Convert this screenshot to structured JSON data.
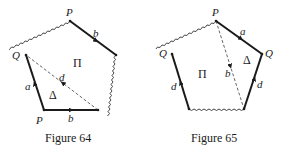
{
  "figures": [
    {
      "caption": "Figure 64",
      "vertex_labels": {
        "top": "P",
        "left": "Q",
        "bottom_left": "P"
      },
      "edge_labels": {
        "top_right": "b",
        "left_lower": "a",
        "bottom": "b",
        "diagonal": "d"
      },
      "region_labels": {
        "upper": "Π",
        "lower": "Δ"
      }
    },
    {
      "caption": "Figure 65",
      "vertex_labels": {
        "top": "P",
        "left": "Q",
        "right": "Q"
      },
      "edge_labels": {
        "top_right": "a",
        "diagonal": "b",
        "left_lower": "d",
        "right_lower": "d"
      },
      "region_labels": {
        "left": "Π",
        "right": "Δ"
      }
    }
  ],
  "colors": {
    "ink": "#1a1a1a",
    "background": "#ffffff"
  }
}
